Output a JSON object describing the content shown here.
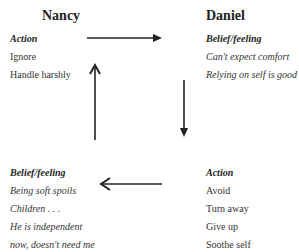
{
  "nancy": {
    "name": "Nancy",
    "action": {
      "heading": "Action",
      "items": [
        "Ignore",
        "Handle harshly"
      ]
    },
    "belief": {
      "heading": "Belief/feeling",
      "items": [
        "Being soft spoils",
        "Children . . .",
        "He is independent",
        "now, doesn't need me"
      ]
    }
  },
  "daniel": {
    "name": "Daniel",
    "belief": {
      "heading": "Belief/feeling",
      "items": [
        "Can't expect comfort",
        "Relying on self is good"
      ]
    },
    "action": {
      "heading": "Action",
      "items": [
        "Avoid",
        "Turn away",
        "Give up",
        "Soothe self"
      ]
    }
  },
  "arrows": [
    "right",
    "down",
    "left",
    "up"
  ]
}
